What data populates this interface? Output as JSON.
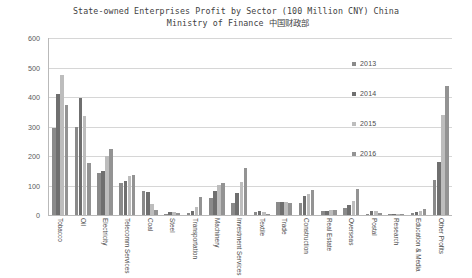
{
  "chart_data": {
    "type": "bar",
    "title": "State-owned Enterprises Profit by Sector (100 Million CNY) China",
    "subtitle": "Ministry of Finance 中国财政部",
    "xlabel": "",
    "ylabel": "",
    "ylim": [
      0,
      600
    ],
    "ytick_labels": [
      "0",
      "100",
      "200",
      "300",
      "400",
      "500",
      "600"
    ],
    "ytick_values": [
      0,
      100,
      200,
      300,
      400,
      500,
      600
    ],
    "grid": true,
    "legend_position": "center-right",
    "categories": [
      "Tobacco",
      "Oil",
      "Electricity",
      "Telecomm Services",
      "Coal",
      "Steel",
      "Transportation",
      "Machinery",
      "Investment Services",
      "Textile",
      "Trade",
      "Construction",
      "Real Estate",
      "Overseas",
      "Postal",
      "Research",
      "Education & Media",
      "Other Profits"
    ],
    "series": [
      {
        "name": "2013",
        "color": "#8a8a8a",
        "values": [
          295,
          299,
          141,
          107,
          82,
          4,
          6,
          56,
          41,
          9,
          43,
          40,
          12,
          25,
          3,
          2,
          6,
          119
        ]
      },
      {
        "name": "2014",
        "color": "#6f6f6f",
        "values": [
          410,
          396,
          149,
          117,
          77,
          9,
          15,
          81,
          74,
          12,
          45,
          66,
          15,
          34,
          14,
          3,
          9,
          179
        ]
      },
      {
        "name": "2015",
        "color": "#bdbdbd",
        "values": [
          474,
          337,
          200,
          131,
          39,
          11,
          28,
          102,
          111,
          11,
          44,
          71,
          16,
          49,
          12,
          2,
          12,
          339
        ]
      },
      {
        "name": "2016",
        "color": "#939393",
        "values": [
          372,
          177,
          224,
          134,
          18,
          7,
          62,
          108,
          161,
          4,
          42,
          85,
          18,
          89,
          6,
          3,
          20,
          439
        ]
      }
    ]
  },
  "legend": {
    "items": [
      {
        "label": "2013",
        "color": "#8a8a8a"
      },
      {
        "label": "2014",
        "color": "#6f6f6f"
      },
      {
        "label": "2015",
        "color": "#bdbdbd"
      },
      {
        "label": "2016",
        "color": "#939393"
      }
    ]
  }
}
